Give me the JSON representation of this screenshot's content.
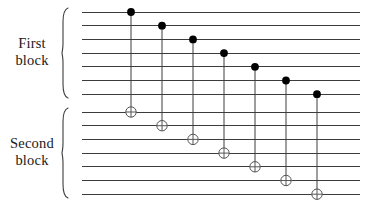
{
  "figure": {
    "width": 371,
    "height": 202,
    "background_color": "#ffffff",
    "wire_color": "#3c3c3c",
    "brace_color": "#3c3c3c",
    "control_color": "#000000",
    "target_color": "#555555",
    "label_color": "#1a1a1a"
  },
  "blocks": [
    {
      "id": "first-block",
      "label_line_1": "First",
      "label_line_2": "block",
      "wire_count": 7,
      "wire_y": [
        12.0,
        25.7,
        39.4,
        53.1,
        66.8,
        80.5,
        94.2
      ],
      "brace_top": 8,
      "brace_bottom": 98
    },
    {
      "id": "second-block",
      "label_line_2": "block",
      "label_line_1": "Second",
      "wire_count": 7,
      "wire_y": [
        112.0,
        125.7,
        139.4,
        153.1,
        166.8,
        180.5,
        194.2
      ],
      "brace_top": 108,
      "brace_bottom": 198
    }
  ],
  "wires": {
    "x_start": 82,
    "x_end": 360,
    "stroke_width": 1.0
  },
  "braces": {
    "x": 68,
    "tip_x": 62,
    "stroke_width": 1.1
  },
  "gates": [
    {
      "name": "cnot-1",
      "x": 131,
      "control_wire": 0,
      "target_wire": 0,
      "control_y": 12.0,
      "target_y": 112.0
    },
    {
      "name": "cnot-2",
      "x": 162,
      "control_wire": 1,
      "target_wire": 1,
      "control_y": 25.7,
      "target_y": 125.7
    },
    {
      "name": "cnot-3",
      "x": 193,
      "control_wire": 2,
      "target_wire": 2,
      "control_y": 39.4,
      "target_y": 139.4
    },
    {
      "name": "cnot-4",
      "x": 224,
      "control_wire": 3,
      "target_wire": 3,
      "control_y": 53.1,
      "target_y": 153.1
    },
    {
      "name": "cnot-5",
      "x": 255,
      "control_wire": 4,
      "target_wire": 4,
      "control_y": 66.8,
      "target_y": 166.8
    },
    {
      "name": "cnot-6",
      "x": 286,
      "control_wire": 5,
      "target_wire": 5,
      "control_y": 80.5,
      "target_y": 180.5
    },
    {
      "name": "cnot-7",
      "x": 317,
      "control_wire": 6,
      "target_wire": 6,
      "control_y": 94.2,
      "target_y": 194.2
    }
  ],
  "gate_style": {
    "control_radius": 3.9,
    "target_radius": 5.2,
    "link_stroke_width": 1.0
  }
}
